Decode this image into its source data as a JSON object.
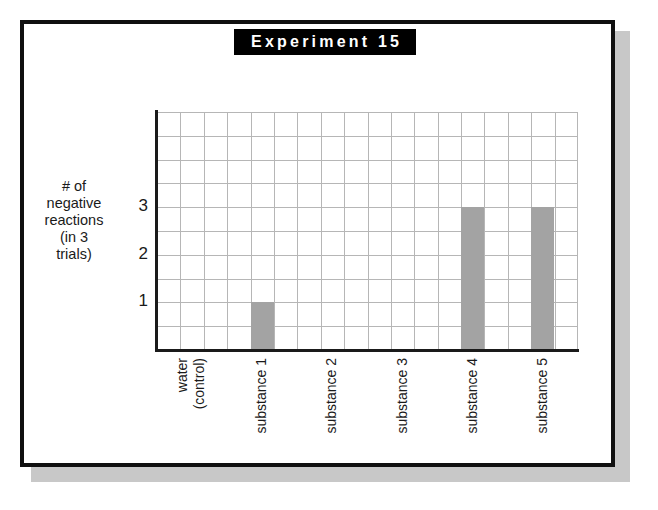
{
  "title": "Experiment 15",
  "chart_data": {
    "type": "bar",
    "title": "Experiment 15",
    "xlabel": "",
    "ylabel": "# of negative reactions (in 3 trials)",
    "ylabel_lines": [
      "# of",
      "negative",
      "reactions",
      "(in 3",
      "trials)"
    ],
    "categories": [
      "water (control)",
      "substance 1",
      "substance 2",
      "substance 3",
      "substance 4",
      "substance 5"
    ],
    "category_lines": [
      [
        "water",
        "(control)"
      ],
      [
        "substance 1"
      ],
      [
        "substance 2"
      ],
      [
        "substance 3"
      ],
      [
        "substance 4"
      ],
      [
        "substance 5"
      ]
    ],
    "values": [
      0,
      1,
      0,
      0,
      3,
      3
    ],
    "ylim": [
      0,
      5
    ],
    "yticks": [
      1,
      2,
      3
    ],
    "ytick_labels": [
      "3",
      "2",
      "1"
    ],
    "grid": true,
    "legend": "none",
    "bar_color": "#a3a3a3",
    "grid_color": "#b6b6b6",
    "axis_color": "#1a1a1a",
    "title_bg_color": "#000000",
    "title_text_color": "#ffffff",
    "frame_color": "#101010",
    "shadow_color": "#c8c8c8",
    "background_color": "#ffffff"
  }
}
